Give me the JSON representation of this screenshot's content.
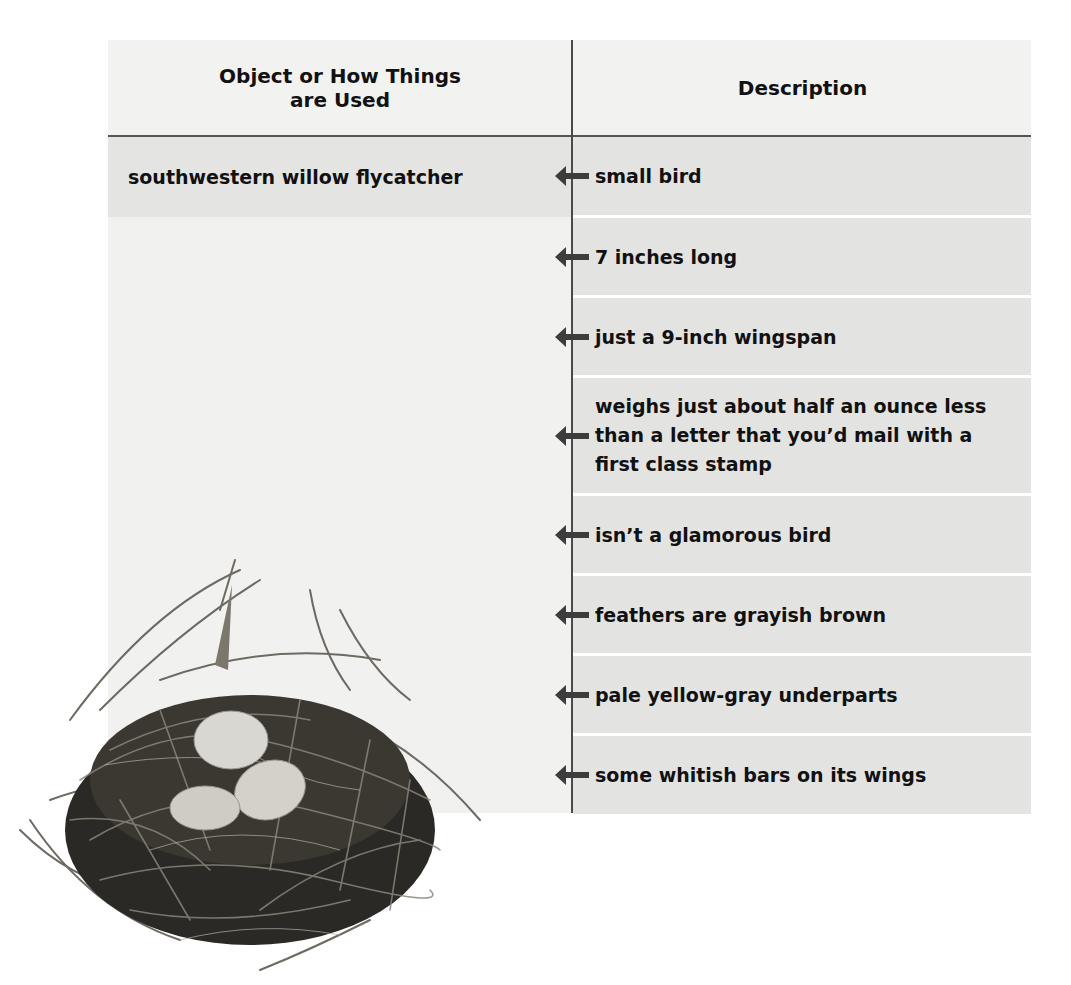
{
  "table": {
    "headers": {
      "left": "Object or How Things are Used",
      "right": "Description"
    },
    "subject": "southwestern willow flycatcher",
    "descriptions": [
      "small bird",
      "7 inches long",
      "just a 9-inch wingspan",
      "weighs just about half an ounce less than a letter that you’d mail with a first class stamp",
      "isn’t a glamorous bird",
      "feathers are grayish brown",
      "pale yellow-gray underparts",
      "some whitish bars on its wings"
    ]
  },
  "illustration": {
    "subject": "bird nest with three eggs",
    "egg_count": 3
  },
  "colors": {
    "header_bg": "#f2f2f1",
    "row_bg": "#e3e3e2",
    "left_col_bg": "#f1f1f0",
    "rule": "#4a4a4a",
    "arrow": "#3d3d3d",
    "text": "#111111"
  }
}
